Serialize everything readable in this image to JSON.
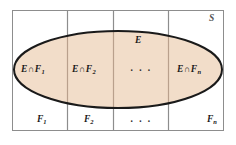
{
  "diagram": {
    "colors": {
      "ellipse_fill": "#f2ddc9",
      "ellipse_stroke": "#1a1a1a",
      "rect_stroke": "#8d8d8d",
      "divider_stroke": "#8d8d8d",
      "background": "#ffffff",
      "text": "#1a1a1a",
      "sample_space_text": "#555555"
    },
    "sample_space_label": "S",
    "event_label": "E",
    "ellipsis": "· · ·",
    "cells": [
      {
        "intersection_prefix": "E",
        "intersection_operator": "∩",
        "intersection_set": "F",
        "intersection_subscript": "1",
        "bottom_label": "F",
        "bottom_subscript": "1"
      },
      {
        "intersection_prefix": "E",
        "intersection_operator": "∩",
        "intersection_set": "F",
        "intersection_subscript": "2",
        "bottom_label": "F",
        "bottom_subscript": "2"
      },
      {
        "intersection_prefix": "",
        "intersection_operator": "",
        "intersection_set": "",
        "intersection_subscript": "",
        "bottom_label": "",
        "bottom_subscript": ""
      },
      {
        "intersection_prefix": "E",
        "intersection_operator": "∩",
        "intersection_set": "F",
        "intersection_subscript": "n",
        "bottom_label": "F",
        "bottom_subscript": "n"
      }
    ]
  }
}
